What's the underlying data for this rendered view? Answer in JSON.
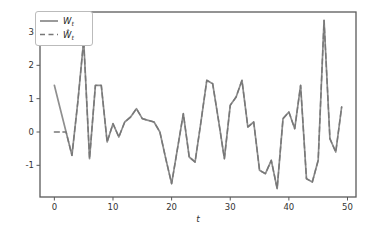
{
  "figure": {
    "xlabel": "t"
  },
  "legend": {
    "entries": [
      {
        "label_main": "W",
        "label_sub": "t",
        "style": "solid"
      },
      {
        "label_main": "Ŵ",
        "label_sub": "t",
        "style": "dashed"
      }
    ]
  },
  "chart_data": {
    "type": "line",
    "title": "",
    "xlabel": "t",
    "ylabel": "",
    "xlim": [
      -2.45,
      51.45
    ],
    "ylim": [
      -1.95,
      3.6
    ],
    "x_ticks": [
      0,
      10,
      20,
      30,
      40,
      50
    ],
    "y_ticks": [
      -1,
      0,
      1,
      2,
      3
    ],
    "grid": false,
    "legend_position": "upper-left",
    "x": [
      0,
      1,
      2,
      3,
      4,
      5,
      6,
      7,
      8,
      9,
      10,
      11,
      12,
      13,
      14,
      15,
      16,
      17,
      18,
      19,
      20,
      21,
      22,
      23,
      24,
      25,
      26,
      27,
      28,
      29,
      30,
      31,
      32,
      33,
      34,
      35,
      36,
      37,
      38,
      39,
      40,
      41,
      42,
      43,
      44,
      45,
      46,
      47,
      48,
      49
    ],
    "series": [
      {
        "name": "Wₜ",
        "label_main": "W",
        "label_sub": "t",
        "style": "solid",
        "color": "#8f8f8f",
        "values": [
          1.4,
          0.7,
          0.0,
          -0.7,
          0.9,
          2.75,
          -0.8,
          1.4,
          1.4,
          -0.3,
          0.25,
          -0.15,
          0.3,
          0.45,
          0.7,
          0.4,
          0.35,
          0.3,
          0.0,
          -0.8,
          -1.55,
          -0.5,
          0.55,
          -0.75,
          -0.9,
          0.3,
          1.55,
          1.45,
          0.35,
          -0.8,
          0.8,
          1.05,
          1.55,
          0.15,
          0.3,
          -1.15,
          -1.25,
          -0.85,
          -1.7,
          0.4,
          0.6,
          0.1,
          1.4,
          -1.4,
          -1.5,
          -0.85,
          3.35,
          -0.2,
          -0.6,
          0.75
        ]
      },
      {
        "name": "Ŵₜ",
        "label_main": "Ŵ",
        "label_sub": "t",
        "style": "dashed",
        "color": "#777777",
        "values": [
          0,
          0,
          0,
          -0.7,
          0.9,
          2.75,
          -0.8,
          1.4,
          1.4,
          -0.3,
          0.25,
          -0.15,
          0.3,
          0.45,
          0.7,
          0.4,
          0.35,
          0.3,
          0.0,
          -0.8,
          -1.55,
          -0.5,
          0.55,
          -0.75,
          -0.9,
          0.3,
          1.55,
          1.45,
          0.35,
          -0.8,
          0.8,
          1.05,
          1.55,
          0.15,
          0.3,
          -1.15,
          -1.25,
          -0.85,
          -1.7,
          0.4,
          0.6,
          0.1,
          1.4,
          -1.4,
          -1.5,
          -0.85,
          3.35,
          -0.2,
          -0.6,
          0.75
        ]
      }
    ],
    "colors": {
      "spine": "#5a5a5a",
      "tick_label": "#333333",
      "legend_border": "#bbbbbb",
      "background": "#ffffff"
    }
  }
}
